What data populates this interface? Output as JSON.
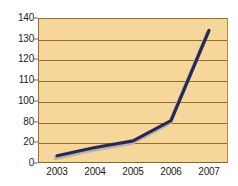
{
  "chart_data": {
    "type": "line",
    "title": "",
    "subtitle": "",
    "xlabel": "",
    "ylabel": "",
    "categories": [
      "2003",
      "2004",
      "2005",
      "2006",
      "2007"
    ],
    "x_tick_labels": [
      "2003",
      "2004",
      "2005",
      "2006",
      "2007"
    ],
    "y_tick_labels": [
      "140",
      "130",
      "120",
      "110",
      "100",
      "80",
      "20",
      "0"
    ],
    "y_tick_values": [
      140,
      130,
      120,
      110,
      100,
      80,
      20,
      0
    ],
    "ylim": [
      0,
      140
    ],
    "grid": true,
    "legend": "none",
    "series": [
      {
        "name": "series-1",
        "values": [
          7,
          15,
          24,
          81,
          134
        ],
        "line_color": "#282850",
        "shadow_color": "#b8b3ad"
      }
    ],
    "colors": {
      "plot_background": "#F5D79B",
      "gridline": "#9A6D27",
      "frame_border": "#9C6F28",
      "line": "#282850",
      "line_shadow": "#B8B3AD",
      "tick_text": "#1B1B1B",
      "page_background": "#FFFFFF"
    }
  }
}
